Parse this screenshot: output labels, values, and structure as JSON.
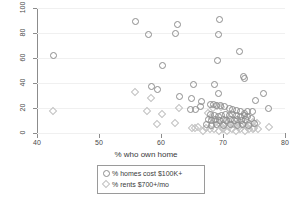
{
  "chart_data": {
    "type": "scatter",
    "title": "",
    "xlabel": "% who own home",
    "ylabel": "",
    "xlim": [
      40,
      80
    ],
    "ylim": [
      0,
      100
    ],
    "xticks": [
      40,
      50,
      60,
      70,
      80
    ],
    "yticks": [
      0,
      20,
      40,
      60,
      80,
      100
    ],
    "grid": "horizontal",
    "legend_position": "below-axis-center",
    "series": [
      {
        "name": "% homes cost $100K+",
        "marker": "circle",
        "color": "#8d8d8d",
        "points": [
          [
            42.6,
            62
          ],
          [
            55.9,
            89
          ],
          [
            57.9,
            79
          ],
          [
            62.6,
            87
          ],
          [
            62.3,
            80
          ],
          [
            69.5,
            91
          ],
          [
            69.2,
            79
          ],
          [
            60.2,
            54
          ],
          [
            69.1,
            58
          ],
          [
            72.6,
            65
          ],
          [
            73.3,
            45
          ],
          [
            73.5,
            44
          ],
          [
            58.5,
            37
          ],
          [
            59.5,
            35
          ],
          [
            65.3,
            39
          ],
          [
            68.7,
            39
          ],
          [
            69.3,
            32
          ],
          [
            63.0,
            29
          ],
          [
            64.9,
            28
          ],
          [
            66.6,
            25
          ],
          [
            75.2,
            26
          ],
          [
            76.6,
            32
          ],
          [
            64.8,
            19
          ],
          [
            65.5,
            19
          ],
          [
            66.3,
            21
          ],
          [
            67.9,
            23
          ],
          [
            68.4,
            23
          ],
          [
            68.9,
            22
          ],
          [
            69.6,
            22
          ],
          [
            70.2,
            21
          ],
          [
            71.0,
            20
          ],
          [
            71.6,
            19
          ],
          [
            72.2,
            18
          ],
          [
            72.8,
            17
          ],
          [
            73.4,
            16
          ],
          [
            74.0,
            17
          ],
          [
            74.8,
            17
          ],
          [
            77.3,
            20
          ],
          [
            68.0,
            15
          ],
          [
            68.6,
            14
          ],
          [
            69.2,
            13
          ],
          [
            69.8,
            14
          ],
          [
            70.4,
            15
          ],
          [
            71.0,
            14
          ],
          [
            71.6,
            15
          ],
          [
            72.2,
            14
          ],
          [
            72.8,
            13
          ],
          [
            73.4,
            14
          ],
          [
            74.0,
            13
          ],
          [
            74.6,
            12
          ],
          [
            67.6,
            11
          ],
          [
            68.2,
            10
          ],
          [
            68.8,
            11
          ],
          [
            69.4,
            10
          ],
          [
            70.0,
            11
          ],
          [
            70.6,
            10
          ],
          [
            71.2,
            11
          ],
          [
            71.8,
            10
          ],
          [
            72.4,
            11
          ],
          [
            73.0,
            10
          ],
          [
            73.6,
            11
          ],
          [
            67.3,
            7
          ],
          [
            68.1,
            6
          ],
          [
            69.0,
            7
          ],
          [
            70.1,
            6
          ],
          [
            71.2,
            7
          ],
          [
            72.3,
            6
          ],
          [
            73.2,
            7
          ],
          [
            74.1,
            6
          ],
          [
            75.0,
            8
          ]
        ]
      },
      {
        "name": "% rents $700+/mo",
        "marker": "diamond",
        "color": "#c2c2c2",
        "points": [
          [
            42.5,
            18
          ],
          [
            55.8,
            33
          ],
          [
            58.3,
            28
          ],
          [
            57.8,
            18
          ],
          [
            59.4,
            7
          ],
          [
            60.2,
            15
          ],
          [
            62.2,
            8
          ],
          [
            62.9,
            20
          ],
          [
            65.0,
            4
          ],
          [
            65.5,
            4
          ],
          [
            66.0,
            5
          ],
          [
            68.4,
            20
          ],
          [
            69.0,
            22
          ],
          [
            69.6,
            21
          ],
          [
            67.6,
            16
          ],
          [
            68.2,
            12
          ],
          [
            68.8,
            9
          ],
          [
            69.4,
            8
          ],
          [
            70.0,
            7
          ],
          [
            70.6,
            9
          ],
          [
            71.2,
            8
          ],
          [
            71.8,
            7
          ],
          [
            72.4,
            8
          ],
          [
            73.0,
            7
          ],
          [
            73.6,
            8
          ],
          [
            74.2,
            7
          ],
          [
            74.8,
            9
          ],
          [
            75.4,
            8
          ],
          [
            67.2,
            4
          ],
          [
            67.9,
            3
          ],
          [
            68.6,
            3
          ],
          [
            69.3,
            2
          ],
          [
            70.0,
            3
          ],
          [
            70.7,
            2
          ],
          [
            71.4,
            3
          ],
          [
            72.1,
            2
          ],
          [
            72.8,
            3
          ],
          [
            73.5,
            2
          ],
          [
            74.2,
            3
          ],
          [
            74.9,
            3
          ],
          [
            75.6,
            3
          ],
          [
            77.4,
            5
          ],
          [
            66.8,
            2
          ],
          [
            69.8,
            5
          ],
          [
            71.0,
            5
          ],
          [
            72.5,
            5
          ],
          [
            73.8,
            5
          ],
          [
            75.0,
            4
          ]
        ]
      }
    ]
  },
  "axis": {
    "x_tick_labels": [
      "40",
      "50",
      "60",
      "70",
      "80"
    ],
    "y_tick_labels": [
      "0",
      "20",
      "40",
      "60",
      "80",
      "100"
    ],
    "x_title": "% who own home"
  },
  "legend": {
    "entries": [
      {
        "label": "% homes cost $100K+",
        "marker": "circle-marker-icon"
      },
      {
        "label": "% rents $700+/mo",
        "marker": "diamond-marker-icon"
      }
    ]
  },
  "colors": {
    "circle_series": "#8d8d8d",
    "diamond_series": "#c2c2c2",
    "axis": "#8c8c8c",
    "grid": "#f0f0f0",
    "text": "#3a3a3a",
    "background": "#ffffff"
  }
}
